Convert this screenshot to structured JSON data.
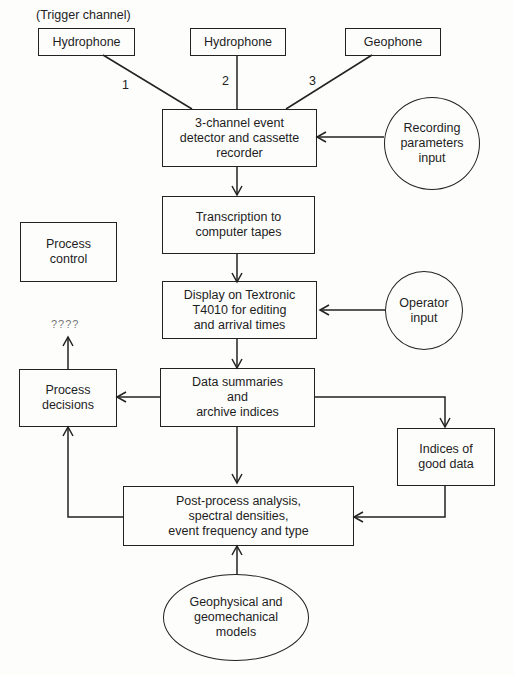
{
  "diagram": {
    "type": "flowchart",
    "annotations": {
      "trigger_channel": "(Trigger channel)",
      "channel_1": "1",
      "channel_2": "2",
      "channel_3": "3",
      "unknown_outcome": "????"
    },
    "nodes": {
      "hydrophone_1": "Hydrophone",
      "hydrophone_2": "Hydrophone",
      "geophone": "Geophone",
      "event_detector": "3-channel event\ndetector and cassette\nrecorder",
      "recording_params": "Recording\nparameters\ninput",
      "transcription": "Transcription to\ncomputer tapes",
      "process_control": "Process\ncontrol",
      "display": "Display on Textronic\nT4010 for editing\nand arrival times",
      "operator_input": "Operator\ninput",
      "data_summaries": "Data summaries\nand\narchive indices",
      "process_decisions": "Process\ndecisions",
      "indices_good_data": "Indices of\ngood data",
      "post_process": "Post-process analysis,\nspectral densities,\nevent frequency and type",
      "models": "Geophysical and\ngeomechanical\nmodels"
    },
    "edges": [
      {
        "from": "hydrophone_1",
        "to": "event_detector",
        "label": "1"
      },
      {
        "from": "hydrophone_2",
        "to": "event_detector",
        "label": "2"
      },
      {
        "from": "geophone",
        "to": "event_detector",
        "label": "3"
      },
      {
        "from": "recording_params",
        "to": "event_detector"
      },
      {
        "from": "event_detector",
        "to": "transcription"
      },
      {
        "from": "transcription",
        "to": "display"
      },
      {
        "from": "operator_input",
        "to": "display"
      },
      {
        "from": "display",
        "to": "data_summaries"
      },
      {
        "from": "data_summaries",
        "to": "process_decisions"
      },
      {
        "from": "data_summaries",
        "to": "indices_good_data"
      },
      {
        "from": "data_summaries",
        "to": "post_process"
      },
      {
        "from": "indices_good_data",
        "to": "post_process"
      },
      {
        "from": "post_process",
        "to": "process_decisions"
      },
      {
        "from": "models",
        "to": "post_process"
      },
      {
        "from": "process_decisions",
        "to": "unknown_outcome"
      }
    ]
  }
}
